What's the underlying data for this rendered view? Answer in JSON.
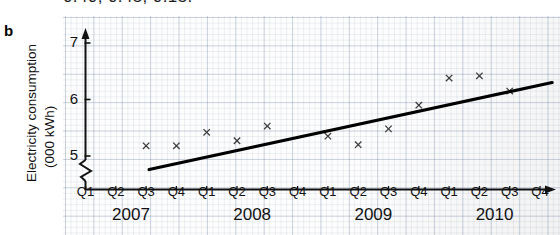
{
  "figure": {
    "panel_label": "b",
    "cropped_caption_above": "0.40, 0.45, 0.15."
  },
  "axes": {
    "y_title_line1": "Electricity consumption",
    "y_title_line2": "(000 kWh)",
    "y_ticks": [
      "5",
      "6",
      "7"
    ],
    "y_axis_break": "zigzag-break",
    "x_quarter_labels": [
      "Q1",
      "Q2",
      "Q3",
      "Q4",
      "Q1",
      "Q2",
      "Q3",
      "Q4",
      "Q1",
      "Q2",
      "Q3",
      "Q4",
      "Q1",
      "Q2",
      "Q3",
      "Q4"
    ],
    "x_year_labels": [
      "2007",
      "2008",
      "2009",
      "2010"
    ]
  },
  "colors": {
    "grid_major": "#7a8caa",
    "grid_minor": "#c3ccdb",
    "axis": "#111111",
    "marker": "#3a3a3a",
    "trendline": "#000000",
    "paper": "#fdfdfd"
  },
  "chart_data": {
    "type": "scatter",
    "title": "",
    "xlabel": "",
    "ylabel": "Electricity consumption (000 kWh)",
    "ylim": [
      4.6,
      7.15
    ],
    "y_ticks": [
      5,
      6,
      7
    ],
    "grid": true,
    "legend": "none",
    "axis_break_below": 5,
    "categories": [
      "2007 Q1",
      "2007 Q2",
      "2007 Q3",
      "2007 Q4",
      "2008 Q1",
      "2008 Q2",
      "2008 Q3",
      "2008 Q4",
      "2009 Q1",
      "2009 Q2",
      "2009 Q3",
      "2009 Q4",
      "2010 Q1",
      "2010 Q2",
      "2010 Q3",
      "2010 Q4"
    ],
    "series": [
      {
        "name": "Electricity consumption",
        "marker": "x",
        "points": [
          {
            "x": "2007 Q3",
            "x_index": 2,
            "y": 5.18
          },
          {
            "x": "2007 Q4",
            "x_index": 3,
            "y": 5.18
          },
          {
            "x": "2008 Q1",
            "x_index": 4,
            "y": 5.42
          },
          {
            "x": "2008 Q2",
            "x_index": 5,
            "y": 5.27
          },
          {
            "x": "2008 Q3",
            "x_index": 6,
            "y": 5.53
          },
          {
            "x": "2009 Q1",
            "x_index": 8,
            "y": 5.35
          },
          {
            "x": "2009 Q2",
            "x_index": 9,
            "y": 5.2
          },
          {
            "x": "2009 Q3",
            "x_index": 10,
            "y": 5.48
          },
          {
            "x": "2009 Q4",
            "x_index": 11,
            "y": 5.9
          },
          {
            "x": "2010 Q1",
            "x_index": 12,
            "y": 6.38
          },
          {
            "x": "2010 Q2",
            "x_index": 13,
            "y": 6.42
          },
          {
            "x": "2010 Q3",
            "x_index": 14,
            "y": 6.15
          }
        ]
      },
      {
        "name": "Trend line",
        "type": "line",
        "start": {
          "x_index": 2.1,
          "y": 4.76
        },
        "end": {
          "x_index": 15.4,
          "y": 6.3
        }
      }
    ]
  }
}
